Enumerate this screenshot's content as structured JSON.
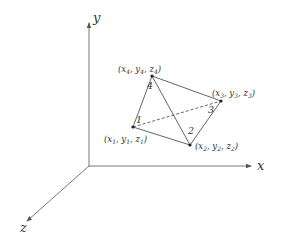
{
  "diagram": {
    "type": "tetrahedron-element-3d-coordinates",
    "axes": {
      "x": {
        "label": "x"
      },
      "y": {
        "label": "y"
      },
      "z": {
        "label": "z"
      }
    },
    "nodes": [
      {
        "id": "1",
        "label": "1",
        "coords": {
          "x": "x",
          "xs": "1",
          "y": "y",
          "ys": "1",
          "z": "z",
          "zs": "1"
        }
      },
      {
        "id": "2",
        "label": "2",
        "coords": {
          "x": "x",
          "xs": "2",
          "y": "y",
          "ys": "2",
          "z": "z",
          "zs": "2"
        }
      },
      {
        "id": "3",
        "label": "3",
        "coords": {
          "x": "x",
          "xs": "3",
          "y": "y",
          "ys": "3",
          "z": "z",
          "zs": "3"
        }
      },
      {
        "id": "4",
        "label": "4",
        "coords": {
          "x": "x",
          "xs": "4",
          "y": "y",
          "ys": "4",
          "z": "z",
          "zs": "4"
        }
      }
    ],
    "edges": [
      {
        "from": "1",
        "to": "4",
        "style": "solid"
      },
      {
        "from": "4",
        "to": "3",
        "style": "solid"
      },
      {
        "from": "4",
        "to": "2",
        "style": "solid"
      },
      {
        "from": "1",
        "to": "2",
        "style": "solid"
      },
      {
        "from": "2",
        "to": "3",
        "style": "solid"
      },
      {
        "from": "1",
        "to": "3",
        "style": "dashed"
      }
    ],
    "colors": {
      "line": "#555555",
      "text": "#333333",
      "background": "#ffffff"
    }
  }
}
